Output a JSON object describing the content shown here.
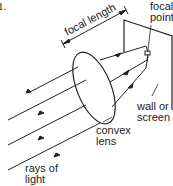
{
  "figure": {
    "number_label": "1.",
    "labels": {
      "focal_length": "focal length",
      "focal_point_line1": "focal",
      "focal_point_line2": "point",
      "wall_line1": "wall or",
      "wall_line2": "screen",
      "lens_line1": "convex",
      "lens_line2": "lens",
      "rays_line1": "rays of",
      "rays_line2": "light"
    },
    "colors": {
      "ink": "#222222",
      "background": "#ffffff"
    }
  }
}
